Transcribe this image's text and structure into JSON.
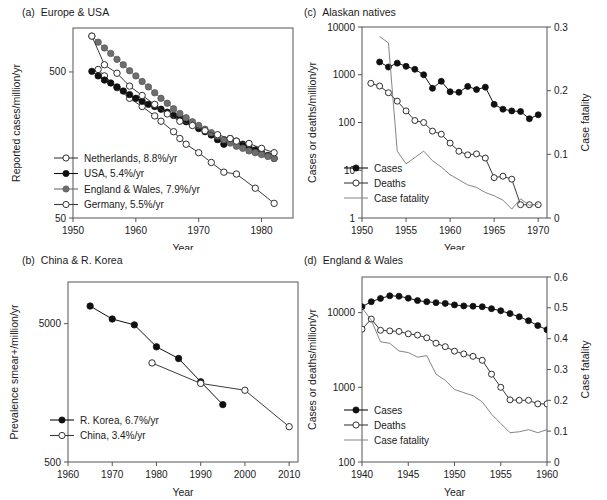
{
  "figure": {
    "panels": [
      "a",
      "b",
      "c",
      "d"
    ]
  },
  "chart_data": [
    {
      "id": "a",
      "panel_label": "(a)",
      "title": "Europe & USA",
      "type": "line",
      "xlabel": "Year",
      "ylabel": "Reported cases/million/yr",
      "yscale": "log",
      "xlim": [
        1950,
        1985
      ],
      "ylim": [
        50,
        1000
      ],
      "xticks": [
        1950,
        1960,
        1970,
        1980
      ],
      "xticklabels": [
        "1950",
        "1960",
        "1970",
        "1980"
      ],
      "yticks": [
        50,
        500
      ],
      "yticklabels": [
        "50",
        "500"
      ],
      "legend_position": "lower-left",
      "series": [
        {
          "name": "Netherlands, 8.8%/yr",
          "marker": "open-circle",
          "color": "#3a3a3a",
          "x": [
            1954,
            1955,
            1957,
            1959,
            1961,
            1963,
            1964,
            1966,
            1967,
            1968,
            1970,
            1972,
            1974,
            1976,
            1979,
            1982
          ],
          "y": [
            520,
            470,
            390,
            330,
            290,
            250,
            230,
            195,
            175,
            160,
            140,
            120,
            103,
            100,
            80,
            63
          ]
        },
        {
          "name": "USA, 5.4%/yr",
          "marker": "filled-circle",
          "color": "#101010",
          "x": [
            1953,
            1954,
            1955,
            1956,
            1957,
            1958,
            1959,
            1960,
            1961,
            1962,
            1963,
            1964,
            1965,
            1966,
            1967,
            1968,
            1969,
            1970,
            1971,
            1972,
            1973,
            1974,
            1975,
            1976,
            1977,
            1978,
            1979,
            1980,
            1981,
            1982
          ],
          "y": [
            505,
            470,
            440,
            420,
            395,
            370,
            350,
            330,
            315,
            300,
            290,
            278,
            265,
            252,
            240,
            228,
            218,
            205,
            195,
            185,
            172,
            160,
            175,
            168,
            160,
            152,
            146,
            140,
            134,
            128
          ]
        },
        {
          "name": "England & Wales, 7.9%/yr",
          "marker": "filled-circle-gray",
          "color": "#6e6e6e",
          "x": [
            1953,
            1954,
            1955,
            1956,
            1957,
            1958,
            1959,
            1960,
            1961,
            1962,
            1963,
            1964,
            1965,
            1966,
            1967,
            1968,
            1969,
            1970,
            1971,
            1972,
            1973,
            1974,
            1975,
            1976,
            1977,
            1978,
            1979,
            1980,
            1981,
            1982
          ],
          "y": [
            880,
            800,
            730,
            670,
            610,
            560,
            510,
            470,
            430,
            395,
            360,
            330,
            305,
            280,
            260,
            243,
            228,
            215,
            203,
            192,
            182,
            172,
            163,
            155,
            150,
            144,
            140,
            136,
            132,
            128
          ]
        },
        {
          "name": "Germany, 5.5%/yr",
          "marker": "open-circle",
          "color": "#3a3a3a",
          "x": [
            1953,
            1955,
            1957,
            1959,
            1961,
            1963,
            1965,
            1967,
            1969,
            1971,
            1973,
            1975,
            1976,
            1978,
            1980,
            1982
          ],
          "y": [
            880,
            560,
            490,
            400,
            345,
            300,
            258,
            230,
            215,
            198,
            186,
            175,
            168,
            162,
            150,
            140
          ]
        }
      ]
    },
    {
      "id": "b",
      "panel_label": "(b)",
      "title": "China & R. Korea",
      "type": "line",
      "xlabel": "Year",
      "ylabel": "Prevalence smear+/million/yr",
      "yscale": "log",
      "xlim": [
        1960,
        2012
      ],
      "ylim": [
        500,
        10000
      ],
      "xticks": [
        1960,
        1970,
        1980,
        1990,
        2000,
        2010
      ],
      "xticklabels": [
        "1960",
        "1970",
        "1980",
        "1990",
        "2000",
        "2010"
      ],
      "yticks": [
        500,
        5000
      ],
      "yticklabels": [
        "500",
        "5000"
      ],
      "legend_position": "lower-left",
      "series": [
        {
          "name": "R. Korea, 6.7%/yr",
          "marker": "filled-circle",
          "color": "#101010",
          "x": [
            1965,
            1970,
            1975,
            1980,
            1985,
            1990,
            1995
          ],
          "y": [
            6700,
            5400,
            4900,
            3400,
            2800,
            1900,
            1300
          ]
        },
        {
          "name": "China, 3.4%/yr",
          "marker": "open-circle",
          "color": "#3a3a3a",
          "x": [
            1979,
            1990,
            2000,
            2010
          ],
          "y": [
            2600,
            1850,
            1650,
            900
          ]
        }
      ]
    },
    {
      "id": "c",
      "panel_label": "(c)",
      "title": "Alaskan natives",
      "type": "line",
      "xlabel": "Year",
      "ylabel": "Cases or deaths/million/yr",
      "ylabel_right": "Case fatality",
      "yscale": "log",
      "xlim": [
        1950,
        1971
      ],
      "ylim": [
        1,
        10000
      ],
      "ylim_right": [
        0,
        0.3
      ],
      "xticks": [
        1950,
        1955,
        1960,
        1965,
        1970
      ],
      "xticklabels": [
        "1950",
        "1955",
        "1960",
        "1965",
        "1970"
      ],
      "yticks": [
        1,
        10,
        100,
        1000,
        10000
      ],
      "yticklabels": [
        "1",
        "10",
        "100",
        "1000",
        "10000"
      ],
      "yticks_right": [
        0,
        0.1,
        0.2,
        0.3
      ],
      "yticklabels_right": [
        "0",
        "0.1",
        "0.2",
        "0.3"
      ],
      "legend_position": "lower-left",
      "series": [
        {
          "name": "Cases",
          "marker": "filled-circle",
          "axis": "left",
          "color": "#101010",
          "x": [
            1952,
            1953,
            1954,
            1955,
            1956,
            1957,
            1958,
            1959,
            1960,
            1961,
            1962,
            1963,
            1964,
            1965,
            1966,
            1967,
            1968,
            1969,
            1970
          ],
          "y": [
            1850,
            1450,
            1750,
            1500,
            1300,
            1000,
            520,
            730,
            440,
            430,
            570,
            490,
            550,
            240,
            190,
            175,
            170,
            120,
            145
          ]
        },
        {
          "name": "Deaths",
          "marker": "open-circle",
          "axis": "left",
          "color": "#3a3a3a",
          "x": [
            1951,
            1952,
            1953,
            1954,
            1955,
            1956,
            1957,
            1958,
            1959,
            1960,
            1961,
            1962,
            1963,
            1964,
            1965,
            1966,
            1967,
            1968,
            1969,
            1970
          ],
          "y": [
            660,
            580,
            420,
            280,
            175,
            110,
            100,
            66,
            57,
            37,
            25,
            21,
            22,
            18,
            7,
            7.5,
            6.5,
            1.9,
            1.9,
            1.9
          ]
        },
        {
          "name": "Case fatality",
          "marker": "none",
          "axis": "right",
          "color": "#767676",
          "x": [
            1952,
            1953,
            1954,
            1955,
            1956,
            1957,
            1958,
            1959,
            1960,
            1961,
            1962,
            1963,
            1964,
            1965,
            1966,
            1967,
            1968,
            1969,
            1970
          ],
          "y": [
            0.285,
            0.275,
            0.105,
            0.085,
            0.095,
            0.105,
            0.09,
            0.08,
            0.068,
            0.06,
            0.052,
            0.048,
            0.04,
            0.035,
            0.028,
            0.014,
            0.03,
            0.02,
            0.022
          ]
        }
      ]
    },
    {
      "id": "d",
      "panel_label": "(d)",
      "title": "England & Wales",
      "type": "line",
      "xlabel": "Year",
      "ylabel": "Cases or deaths/million/yr",
      "ylabel_right": "Case fatality",
      "yscale": "log",
      "xlim": [
        1940,
        1960
      ],
      "ylim": [
        100,
        30000
      ],
      "ylim_right": [
        0,
        0.6
      ],
      "xticks": [
        1940,
        1945,
        1950,
        1955,
        1960
      ],
      "xticklabels": [
        "1940",
        "1945",
        "1950",
        "1955",
        "1960"
      ],
      "yticks": [
        100,
        1000,
        10000
      ],
      "yticklabels": [
        "100",
        "1000",
        "10000"
      ],
      "yticks_right": [
        0,
        0.1,
        0.2,
        0.3,
        0.4,
        0.5,
        0.6
      ],
      "yticklabels_right": [
        "0",
        "0.1",
        "0.2",
        "0.3",
        "0.4",
        "0.5",
        "0.6"
      ],
      "legend_position": "lower-left",
      "series": [
        {
          "name": "Cases",
          "marker": "filled-circle",
          "axis": "left",
          "color": "#101010",
          "x": [
            1940,
            1941,
            1942,
            1943,
            1944,
            1945,
            1946,
            1947,
            1948,
            1949,
            1950,
            1951,
            1952,
            1953,
            1954,
            1955,
            1956,
            1957,
            1958,
            1959,
            1960
          ],
          "y": [
            12000,
            14000,
            15500,
            16800,
            16600,
            15600,
            14500,
            14000,
            13600,
            13300,
            12700,
            12300,
            12200,
            12000,
            11300,
            10600,
            9700,
            8800,
            7800,
            6700,
            5900
          ]
        },
        {
          "name": "Deaths",
          "marker": "open-circle",
          "axis": "left",
          "color": "#3a3a3a",
          "x": [
            1940,
            1941,
            1942,
            1943,
            1944,
            1945,
            1946,
            1947,
            1948,
            1949,
            1950,
            1951,
            1952,
            1953,
            1954,
            1955,
            1956,
            1957,
            1958,
            1959,
            1960
          ],
          "y": [
            6000,
            8200,
            5800,
            5700,
            5600,
            5200,
            5000,
            4600,
            3900,
            3500,
            3050,
            2800,
            2600,
            2300,
            1500,
            1000,
            680,
            670,
            670,
            600,
            600
          ]
        },
        {
          "name": "Case fatality",
          "marker": "none",
          "axis": "right",
          "color": "#767676",
          "x": [
            1940,
            1941,
            1942,
            1943,
            1944,
            1945,
            1946,
            1947,
            1948,
            1949,
            1950,
            1951,
            1952,
            1953,
            1954,
            1955,
            1956,
            1957,
            1958,
            1959,
            1960
          ],
          "y": [
            0.5,
            0.46,
            0.39,
            0.385,
            0.36,
            0.355,
            0.34,
            0.345,
            0.285,
            0.265,
            0.235,
            0.225,
            0.215,
            0.195,
            0.155,
            0.125,
            0.095,
            0.098,
            0.105,
            0.095,
            0.105
          ]
        }
      ]
    }
  ]
}
